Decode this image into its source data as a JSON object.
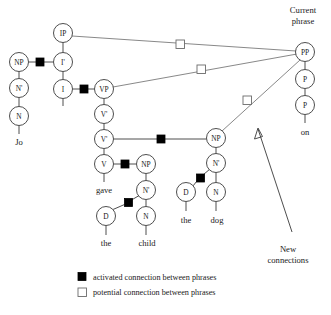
{
  "figure": {
    "width": 331,
    "height": 315,
    "background": "#ffffff",
    "line_color": "#3a3a3a",
    "link_color": "#6a6a6a",
    "activated_color": "#000000",
    "potential_color": "#ffffff"
  },
  "nodes": {
    "np_jo": {
      "label": "NP",
      "x": 19,
      "y": 62,
      "r": 9.5
    },
    "nbar_jo": {
      "label": "N'",
      "x": 19,
      "y": 88,
      "r": 9.5
    },
    "n_jo": {
      "label": "N",
      "x": 19,
      "y": 116,
      "r": 9.5
    },
    "ip": {
      "label": "IP",
      "x": 63,
      "y": 33,
      "r": 9.5
    },
    "ibar": {
      "label": "I'",
      "x": 63,
      "y": 62,
      "r": 9.5
    },
    "i": {
      "label": "I",
      "x": 63,
      "y": 89,
      "r": 9.5
    },
    "vp": {
      "label": "VP",
      "x": 104,
      "y": 89,
      "r": 9.5
    },
    "vbar1": {
      "label": "V'",
      "x": 104,
      "y": 114,
      "r": 9.5
    },
    "vbar2": {
      "label": "V'",
      "x": 104,
      "y": 139,
      "r": 9.5
    },
    "v": {
      "label": "V",
      "x": 104,
      "y": 164,
      "r": 9.5
    },
    "np_child": {
      "label": "NP",
      "x": 146,
      "y": 164,
      "r": 9.5
    },
    "nbar_child": {
      "label": "N'",
      "x": 146,
      "y": 190,
      "r": 9.5
    },
    "n_child": {
      "label": "N",
      "x": 146,
      "y": 216,
      "r": 9.5
    },
    "d_child": {
      "label": "D",
      "x": 106,
      "y": 216,
      "r": 9.5
    },
    "np_dog": {
      "label": "NP",
      "x": 216,
      "y": 138,
      "r": 9.5
    },
    "nbar_dog": {
      "label": "N'",
      "x": 216,
      "y": 163,
      "r": 9.5
    },
    "n_dog": {
      "label": "N",
      "x": 216,
      "y": 192,
      "r": 9.5
    },
    "d_dog": {
      "label": "D",
      "x": 186,
      "y": 192,
      "r": 9.5
    },
    "pp": {
      "label": "PP",
      "x": 305,
      "y": 52,
      "r": 9.5
    },
    "p1": {
      "label": "P",
      "x": 305,
      "y": 79,
      "r": 9.5
    },
    "p2": {
      "label": "P",
      "x": 305,
      "y": 105,
      "r": 9.5
    }
  },
  "words": [
    {
      "name": "word-jo",
      "text": "Jo",
      "x": 19,
      "y": 142
    },
    {
      "name": "word-gave",
      "text": "gave",
      "x": 104,
      "y": 190
    },
    {
      "name": "word-the-1",
      "text": "the",
      "x": 106,
      "y": 243
    },
    {
      "name": "word-child",
      "text": "child",
      "x": 147,
      "y": 243
    },
    {
      "name": "word-the-2",
      "text": "the",
      "x": 186,
      "y": 220
    },
    {
      "name": "word-dog",
      "text": "dog",
      "x": 217,
      "y": 220
    },
    {
      "name": "word-on",
      "text": "on",
      "x": 305,
      "y": 132
    }
  ],
  "annotations": {
    "current_phrase": {
      "line1": "Current",
      "line2": "phrase",
      "x": 303,
      "y": 13
    },
    "new_connections": {
      "line1": "New",
      "line2": "connections",
      "x": 286,
      "y": 248
    }
  },
  "activated_squares": [
    {
      "name": "sq-np-ibar",
      "x": 40,
      "y": 62
    },
    {
      "name": "sq-i-vp",
      "x": 84,
      "y": 89
    },
    {
      "name": "sq-vbar-np-child",
      "x": 161,
      "y": 139
    },
    {
      "name": "sq-v-np",
      "x": 125,
      "y": 164
    },
    {
      "name": "sq-d-nbar-child",
      "x": 128,
      "y": 202
    },
    {
      "name": "sq-d-nbar-dog",
      "x": 200,
      "y": 178
    }
  ],
  "potential_squares": [
    {
      "name": "sq-ip-pp",
      "x": 180,
      "y": 44
    },
    {
      "name": "sq-vp-pp",
      "x": 201,
      "y": 69
    },
    {
      "name": "sq-np-pp",
      "x": 247,
      "y": 100
    }
  ],
  "legend": {
    "items": [
      {
        "marker": "activated-square",
        "label": "activated connection between phrases"
      },
      {
        "marker": "potential-square",
        "label": "potential connection between phrases"
      }
    ]
  }
}
